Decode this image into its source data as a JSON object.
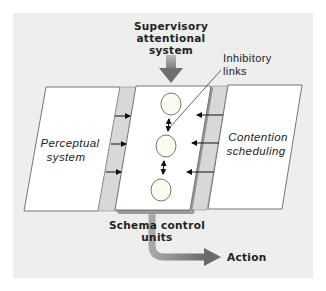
{
  "diagram": {
    "type": "schema-control-model",
    "background_color": "#eeeeee",
    "panel_color": "#ffffff",
    "arrow_color": "#8a8a8a",
    "nodes": {
      "supervisory": {
        "line1": "Supervisory",
        "line2": "attentional",
        "line3": "system"
      },
      "inhibitory": {
        "line1": "Inhibitory",
        "line2": "links"
      },
      "perceptual": {
        "line1": "Perceptual",
        "line2": "system"
      },
      "contention": {
        "line1": "Contention",
        "line2": "scheduling"
      },
      "schema": {
        "line1": "Schema control",
        "line2": "units"
      },
      "action": {
        "label": "Action"
      }
    },
    "schema_units_count": 3,
    "edges": [
      {
        "from": "Supervisory attentional system",
        "to": "Schema control units"
      },
      {
        "from": "Perceptual system",
        "to": "Schema control units",
        "count": 3
      },
      {
        "from": "Contention scheduling",
        "to": "Schema control units",
        "count": 3
      },
      {
        "from": "Schema control units",
        "to": "Action"
      },
      {
        "from": "schema unit",
        "to": "schema unit",
        "type": "inhibitory, bidirectional",
        "count": 2
      }
    ]
  }
}
